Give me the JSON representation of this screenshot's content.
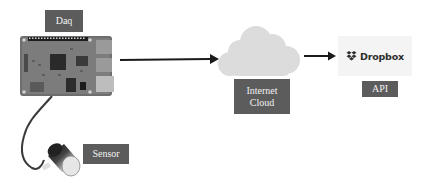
{
  "diagram": {
    "nodes": {
      "daq": {
        "label": "Daq",
        "icon": "raspberry-pi-board-icon"
      },
      "sensor": {
        "label": "Sensor",
        "icon": "sensor-probe-icon"
      },
      "internet_cloud": {
        "label_line1": "Internet",
        "label_line2": "Cloud",
        "icon": "cloud-icon"
      },
      "api": {
        "label": "API",
        "logo_text": "Dropbox",
        "icon": "dropbox-logo-icon"
      }
    },
    "edges": [
      {
        "from": "daq",
        "to": "internet_cloud",
        "type": "arrow"
      },
      {
        "from": "internet_cloud",
        "to": "api",
        "type": "arrow"
      },
      {
        "from": "sensor",
        "to": "daq",
        "type": "cable"
      }
    ],
    "colors": {
      "label_bg": "#5c5c5c",
      "label_text": "#f2f2f2",
      "cloud": "#dcdcdc",
      "arrow": "#1a1a1a",
      "logo_bg": "#f4f4f4"
    }
  }
}
